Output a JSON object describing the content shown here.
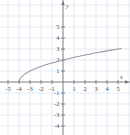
{
  "figure": {
    "problem_label": "2.",
    "background_color": "#ffffff",
    "grid_color": "#c9d8e8",
    "axis_color": "#6e6e76",
    "curve_color": "#9a9aa2"
  },
  "chart_data": {
    "type": "line",
    "title": "",
    "subtitle": "",
    "xlabel": "x",
    "ylabel": "y",
    "function": "y = sqrt(x + 4)",
    "xlim": [
      -5.4,
      5.6
    ],
    "ylim": [
      -5.3,
      5.4
    ],
    "grid": true,
    "grid_step": 1,
    "legend": "none",
    "x_ticks": [
      -5,
      -4,
      -3,
      -2,
      -1,
      1,
      2,
      3,
      4,
      5
    ],
    "x_tick_labels": [
      "-5",
      "-4",
      "-3",
      "-2",
      "-1",
      "1",
      "2",
      "3",
      "4",
      "5"
    ],
    "y_ticks": [
      5,
      4,
      3,
      2,
      1,
      -1,
      -2,
      -3,
      -4,
      -5
    ],
    "y_tick_labels": [
      "5",
      "4",
      "3",
      "2",
      "1",
      "-1",
      "-2",
      "-3",
      "-4",
      "-5"
    ],
    "series": [
      {
        "name": "y = sqrt(x + 4)",
        "color": "#9a9aa2",
        "x": [
          -4,
          -3.9,
          -3.8,
          -3.6,
          -3.4,
          -3.2,
          -3,
          -2.75,
          -2.5,
          -2.25,
          -2,
          -1.5,
          -1,
          -0.5,
          0,
          0.5,
          1,
          1.5,
          2,
          2.5,
          3,
          3.5,
          4,
          4.5,
          5,
          5.3
        ],
        "y": [
          0,
          0.32,
          0.45,
          0.63,
          0.77,
          0.89,
          1,
          1.12,
          1.22,
          1.32,
          1.41,
          1.58,
          1.73,
          1.87,
          2,
          2.12,
          2.24,
          2.35,
          2.45,
          2.55,
          2.65,
          2.74,
          2.83,
          2.92,
          3,
          3.05
        ]
      }
    ],
    "key_points": [
      {
        "label": "start",
        "x": -4,
        "y": 0
      },
      {
        "label": "y-intercept",
        "x": 0,
        "y": 2
      },
      {
        "label": "end",
        "x": 5,
        "y": 3
      }
    ]
  }
}
